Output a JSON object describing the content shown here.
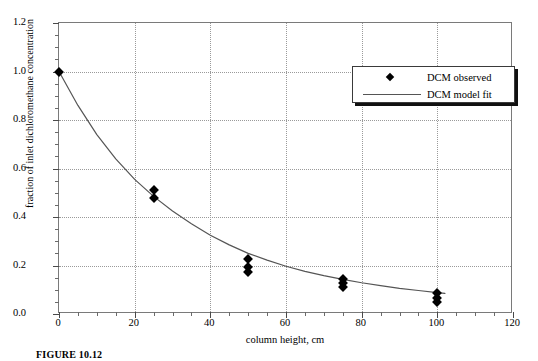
{
  "chart_data": {
    "type": "scatter",
    "title": "",
    "xlabel": "column height, cm",
    "ylabel": "fraction of inlet dichloromethane concentration",
    "xlim": [
      0,
      120
    ],
    "ylim": [
      0.0,
      1.2
    ],
    "xticks": [
      0,
      20,
      40,
      60,
      80,
      100,
      120
    ],
    "xtick_labels": [
      "0",
      "20",
      "40",
      "60",
      "80",
      "100",
      "120"
    ],
    "yticks": [
      0.0,
      0.2,
      0.4,
      0.6,
      0.8,
      1.0,
      1.2
    ],
    "ytick_labels": [
      "0.0",
      "0.2",
      "0.4",
      "0.6",
      "0.8",
      "1.0",
      "1.2"
    ],
    "x_minor_interval": 5,
    "y_minor_interval": 0.05,
    "grid": true,
    "grid_style": "dotted",
    "legend_position": "top-right",
    "series": [
      {
        "name": "DCM observed",
        "type": "scatter",
        "marker": "diamond",
        "color": "#000000",
        "points": [
          {
            "x": 0,
            "y": 1.0
          },
          {
            "x": 25,
            "y": 0.51
          },
          {
            "x": 25,
            "y": 0.48
          },
          {
            "x": 50,
            "y": 0.225
          },
          {
            "x": 50,
            "y": 0.195
          },
          {
            "x": 50,
            "y": 0.175
          },
          {
            "x": 75,
            "y": 0.145
          },
          {
            "x": 75,
            "y": 0.128
          },
          {
            "x": 75,
            "y": 0.112
          },
          {
            "x": 100,
            "y": 0.085
          },
          {
            "x": 100,
            "y": 0.065
          },
          {
            "x": 100,
            "y": 0.048
          }
        ]
      },
      {
        "name": "DCM model fit",
        "type": "line",
        "color": "#555555",
        "points": [
          {
            "x": 0,
            "y": 1.0
          },
          {
            "x": 5,
            "y": 0.86
          },
          {
            "x": 10,
            "y": 0.74
          },
          {
            "x": 15,
            "y": 0.64
          },
          {
            "x": 20,
            "y": 0.555
          },
          {
            "x": 25,
            "y": 0.485
          },
          {
            "x": 30,
            "y": 0.425
          },
          {
            "x": 35,
            "y": 0.372
          },
          {
            "x": 40,
            "y": 0.325
          },
          {
            "x": 45,
            "y": 0.285
          },
          {
            "x": 50,
            "y": 0.25
          },
          {
            "x": 55,
            "y": 0.222
          },
          {
            "x": 60,
            "y": 0.197
          },
          {
            "x": 65,
            "y": 0.176
          },
          {
            "x": 70,
            "y": 0.158
          },
          {
            "x": 75,
            "y": 0.143
          },
          {
            "x": 80,
            "y": 0.129
          },
          {
            "x": 85,
            "y": 0.117
          },
          {
            "x": 90,
            "y": 0.106
          },
          {
            "x": 95,
            "y": 0.097
          },
          {
            "x": 100,
            "y": 0.088
          },
          {
            "x": 102,
            "y": 0.085
          }
        ]
      }
    ]
  },
  "legend": {
    "entries": [
      {
        "label": "DCM observed",
        "symbol": "diamond-marker"
      },
      {
        "label": "DCM model fit",
        "symbol": "line-sample"
      }
    ]
  },
  "caption": {
    "text": "FIGURE 10.12"
  },
  "colors": {
    "frame": "#7a7a7a",
    "grid": "#9a9a9a",
    "marker": "#000000",
    "curve": "#555555",
    "legend_border": "#3a3a3a",
    "legend_shadow": "#111111",
    "background": "#ffffff"
  }
}
